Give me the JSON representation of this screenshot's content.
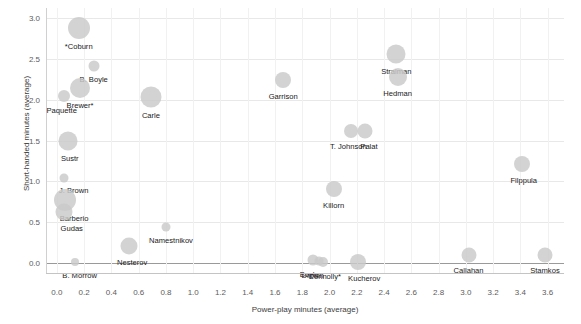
{
  "chart_data": {
    "type": "scatter",
    "title": "",
    "xlabel": "Power-play minutes (average)",
    "ylabel": "Short-handed minutes (average)",
    "xlim": [
      -0.08,
      3.72
    ],
    "ylim": [
      -0.12,
      3.12
    ],
    "xticks": [
      "0.0",
      "0.2",
      "0.4",
      "0.6",
      "0.8",
      "1.0",
      "1.2",
      "1.4",
      "1.6",
      "1.8",
      "2.0",
      "2.2",
      "2.4",
      "2.6",
      "2.8",
      "3.0",
      "3.2",
      "3.4",
      "3.6"
    ],
    "xtick_values": [
      0.0,
      0.2,
      0.4,
      0.6,
      0.8,
      1.0,
      1.2,
      1.4,
      1.6,
      1.8,
      2.0,
      2.2,
      2.4,
      2.6,
      2.8,
      3.0,
      3.2,
      3.4,
      3.6
    ],
    "yticks": [
      "0.0",
      "0.5",
      "1.0",
      "1.5",
      "2.0",
      "2.5",
      "3.0"
    ],
    "ytick_values": [
      0.0,
      0.5,
      1.0,
      1.5,
      2.0,
      2.5,
      3.0
    ],
    "grid": true,
    "legend": "none",
    "marker_color": "#c9c9c9",
    "marker_opacity": 0.82,
    "points": [
      {
        "label": "*Coburn",
        "x": 0.16,
        "y": 2.88,
        "size": 22,
        "label_dx": 0,
        "label_dy": 14
      },
      {
        "label": "B. Boyle",
        "x": 0.27,
        "y": 2.41,
        "size": 11,
        "label_dx": 0,
        "label_dy": 9
      },
      {
        "label": "Brewer*",
        "x": 0.17,
        "y": 2.14,
        "size": 20,
        "label_dx": 0,
        "label_dy": 13
      },
      {
        "label": "Paquette",
        "x": 0.05,
        "y": 2.05,
        "size": 12,
        "label_dx": -2,
        "label_dy": 10
      },
      {
        "label": "Carle",
        "x": 0.69,
        "y": 2.03,
        "size": 21,
        "label_dx": 0,
        "label_dy": 14
      },
      {
        "label": "Garrison",
        "x": 1.66,
        "y": 2.24,
        "size": 16,
        "label_dx": 0,
        "label_dy": 12
      },
      {
        "label": "Stralman",
        "x": 2.49,
        "y": 2.56,
        "size": 19,
        "label_dx": 0,
        "label_dy": 13
      },
      {
        "label": "Hedman",
        "x": 2.5,
        "y": 2.28,
        "size": 18,
        "label_dx": 0,
        "label_dy": 12
      },
      {
        "label": "T. Johnson",
        "x": 2.16,
        "y": 1.62,
        "size": 14,
        "label_dx": -3,
        "label_dy": 11
      },
      {
        "label": "Palat",
        "x": 2.26,
        "y": 1.62,
        "size": 15,
        "label_dx": 4,
        "label_dy": 11
      },
      {
        "label": "Sustr",
        "x": 0.08,
        "y": 1.49,
        "size": 19,
        "label_dx": 2,
        "label_dy": 13
      },
      {
        "label": "J. Brown",
        "x": 0.05,
        "y": 1.04,
        "size": 9,
        "label_dx": 10,
        "label_dy": 8
      },
      {
        "label": "Barberio",
        "x": 0.06,
        "y": 0.77,
        "size": 22,
        "label_dx": 9,
        "label_dy": 14
      },
      {
        "label": "Gudas",
        "x": 0.05,
        "y": 0.62,
        "size": 17,
        "label_dx": 8,
        "label_dy": 12
      },
      {
        "label": "Filppula",
        "x": 3.41,
        "y": 1.21,
        "size": 16,
        "label_dx": 2,
        "label_dy": 12
      },
      {
        "label": "Killorn",
        "x": 2.03,
        "y": 0.91,
        "size": 16,
        "label_dx": 0,
        "label_dy": 12
      },
      {
        "label": "Namestnikov",
        "x": 0.8,
        "y": 0.44,
        "size": 9,
        "label_dx": 5,
        "label_dy": 9
      },
      {
        "label": "Nesterov",
        "x": 0.53,
        "y": 0.21,
        "size": 17,
        "label_dx": 3,
        "label_dy": 12
      },
      {
        "label": "B. Morrow",
        "x": 0.13,
        "y": 0.01,
        "size": 8,
        "label_dx": 5,
        "label_dy": 9
      },
      {
        "label": "Boyle",
        "x": 1.88,
        "y": 0.04,
        "size": 11,
        "label_dx": -4,
        "label_dy": 10
      },
      {
        "label": "Connolly*",
        "x": 1.95,
        "y": 0.02,
        "size": 10,
        "label_dx": 2,
        "label_dy": 10
      },
      {
        "label": "Drouin",
        "x": 1.92,
        "y": 0.03,
        "size": 9,
        "label_dx": -6,
        "label_dy": 10
      },
      {
        "label": "Kucherov",
        "x": 2.21,
        "y": 0.02,
        "size": 16,
        "label_dx": 6,
        "label_dy": 12
      },
      {
        "label": "Callahan",
        "x": 3.02,
        "y": 0.1,
        "size": 15,
        "label_dx": 0,
        "label_dy": 11
      },
      {
        "label": "Stamkos",
        "x": 3.58,
        "y": 0.1,
        "size": 15,
        "label_dx": 0,
        "label_dy": 11
      }
    ]
  }
}
